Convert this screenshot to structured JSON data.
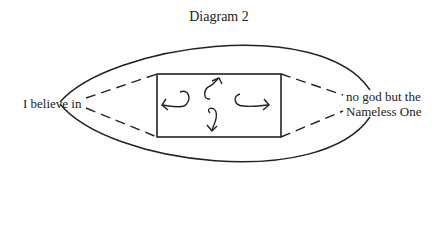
{
  "title": "Diagram 2",
  "labels": {
    "left": "I believe in",
    "right_line1": "no god but the",
    "right_line2": "Nameless One"
  },
  "shapes": {
    "outer": "lens/eye-shaped closed curve",
    "inner": "rectangle with four curved arrows pointing left, up, right, down",
    "connectors": "dashed lines from label tips to rectangle corners"
  },
  "colors": {
    "stroke": "#222222",
    "background": "#ffffff"
  }
}
